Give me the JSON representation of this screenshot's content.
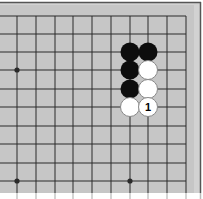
{
  "diagram": {
    "type": "go-board-fragment",
    "colors": {
      "board": "#c6c6c6",
      "margin": "#d2d2d2",
      "frame": "#555555",
      "line": "#2a2a2a",
      "black_stone": "#0d0d0d",
      "white_stone": "#ffffff",
      "white_outline": "#888888"
    },
    "grid": {
      "x_lines": [
        17,
        36,
        55,
        73,
        92,
        111,
        130,
        148,
        167,
        186
      ],
      "y_lines": [
        16,
        34,
        52,
        70,
        89,
        107,
        126,
        144,
        163,
        181
      ],
      "stone_radius": 9.5
    },
    "star_points": [
      {
        "col": 0,
        "row": 3
      },
      {
        "col": 0,
        "row": 9
      },
      {
        "col": 6,
        "row": 9
      }
    ],
    "stones": [
      {
        "col": 6,
        "row": 2,
        "color": "black",
        "label": ""
      },
      {
        "col": 7,
        "row": 2,
        "color": "black",
        "label": ""
      },
      {
        "col": 6,
        "row": 3,
        "color": "black",
        "label": ""
      },
      {
        "col": 7,
        "row": 3,
        "color": "white",
        "label": ""
      },
      {
        "col": 6,
        "row": 4,
        "color": "black",
        "label": ""
      },
      {
        "col": 7,
        "row": 4,
        "color": "white",
        "label": ""
      },
      {
        "col": 6,
        "row": 5,
        "color": "white",
        "label": ""
      },
      {
        "col": 7,
        "row": 5,
        "color": "white",
        "label": "1"
      }
    ]
  }
}
